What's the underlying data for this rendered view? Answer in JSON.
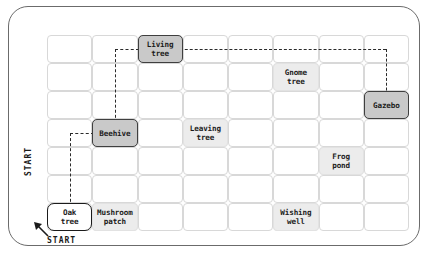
{
  "board": {
    "title": "garden grid path map",
    "columns": 8,
    "rows": 7,
    "colors": {
      "board_border": "#6b6b6b",
      "cell_border": "#d8d8d8",
      "lit_cell_fill": "#ececec",
      "node_fill": "#c9c9c9",
      "node_border": "#3f3f3f",
      "start_fill": "#ffffff",
      "start_border": "#1b1b1b",
      "path_stroke": "#2a2a2a",
      "text": "#1b1b1b"
    }
  },
  "labels": {
    "start_left": "START",
    "start_bottom": "START",
    "start_arrow_icon": "arrow-up-left-icon"
  },
  "cells": [
    {
      "name": "living-tree",
      "label": "Living\ntree",
      "col": 3,
      "row": 1,
      "style": "node"
    },
    {
      "name": "gnome-tree",
      "label": "Gnome\ntree",
      "col": 6,
      "row": 2,
      "style": "lit"
    },
    {
      "name": "gazebo",
      "label": "Gazebo",
      "col": 8,
      "row": 3,
      "style": "node"
    },
    {
      "name": "beehive",
      "label": "Beehive",
      "col": 2,
      "row": 4,
      "style": "node"
    },
    {
      "name": "leaving-tree",
      "label": "Leaving\ntree",
      "col": 4,
      "row": 4,
      "style": "lit"
    },
    {
      "name": "frog-pond",
      "label": "Frog\npond",
      "col": 7,
      "row": 5,
      "style": "lit"
    },
    {
      "name": "oak-tree",
      "label": "Oak\ntree",
      "col": 1,
      "row": 7,
      "style": "start"
    },
    {
      "name": "mushroom-patch",
      "label": "Mushroom\npatch",
      "col": 2,
      "row": 7,
      "style": "lit"
    },
    {
      "name": "wishing-well",
      "label": "Wishing\nwell",
      "col": 6,
      "row": 7,
      "style": "lit"
    }
  ],
  "path": {
    "description": "Oak tree to Gazebo dashed route",
    "segments": [
      {
        "name": "oak-up",
        "type": "v",
        "col": 1,
        "from_row": 7,
        "to_row": 4
      },
      {
        "name": "oak-to-beehive",
        "type": "h",
        "row": 4,
        "from_col": 1,
        "to_col": 2
      },
      {
        "name": "beehive-up",
        "type": "v",
        "col": 2,
        "from_row": 4,
        "to_row": 1
      },
      {
        "name": "beehive-to-living",
        "type": "h",
        "row": 1,
        "from_col": 2,
        "to_col": 3
      },
      {
        "name": "living-to-gazebo",
        "type": "h",
        "row": 1,
        "from_col": 3,
        "to_col": 8
      },
      {
        "name": "gazebo-down",
        "type": "v",
        "col": 8,
        "from_row": 1,
        "to_row": 3
      }
    ]
  },
  "chart_data": {
    "type": "table",
    "columns": 8,
    "rows": 7,
    "occupied": [
      {
        "label": "Living tree",
        "col": 3,
        "row": 1
      },
      {
        "label": "Gnome tree",
        "col": 6,
        "row": 2
      },
      {
        "label": "Gazebo",
        "col": 8,
        "row": 3
      },
      {
        "label": "Beehive",
        "col": 2,
        "row": 4
      },
      {
        "label": "Leaving tree",
        "col": 4,
        "row": 4
      },
      {
        "label": "Frog pond",
        "col": 7,
        "row": 5
      },
      {
        "label": "Oak tree",
        "col": 1,
        "row": 7
      },
      {
        "label": "Mushroom patch",
        "col": 2,
        "row": 7
      },
      {
        "label": "Wishing well",
        "col": 6,
        "row": 7
      }
    ],
    "route": [
      "Oak tree",
      "Beehive",
      "Living tree",
      "Gazebo"
    ]
  }
}
